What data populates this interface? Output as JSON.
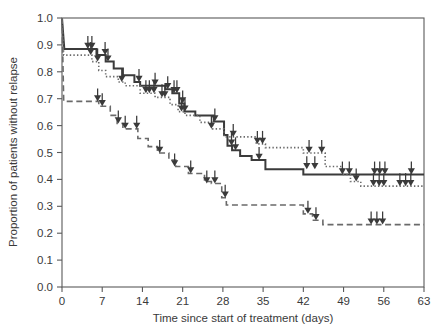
{
  "chart_data": {
    "type": "line",
    "subtype": "kaplan-meier-step",
    "title": "",
    "subtitle": "",
    "xlabel": "Time since start of treatment (days)",
    "ylabel": "Proportion of patients without relapse",
    "xlim": [
      0,
      63
    ],
    "ylim": [
      0.0,
      1.0
    ],
    "xticks": [
      0,
      7,
      14,
      21,
      28,
      35,
      42,
      49,
      56,
      63
    ],
    "xticklabels": [
      "0",
      "7",
      "14",
      "21",
      "28",
      "35",
      "42",
      "49",
      "56",
      "63"
    ],
    "yticks": [
      0.0,
      0.1,
      0.2,
      0.3,
      0.4,
      0.5,
      0.6,
      0.7,
      0.8,
      0.9,
      1.0
    ],
    "yticklabels": [
      "0.0",
      "0.1",
      "0.2",
      "0.3",
      "0.4",
      "0.5",
      "0.6",
      "0.7",
      "0.8",
      "0.9",
      "1.0"
    ],
    "grid": false,
    "legend": false,
    "legend_position": "none",
    "annotations": [
      "Downward arrows with filled triangular heads mark censored observations on each curve"
    ],
    "series": [
      {
        "name": "solid-curve",
        "style": "solid",
        "color": "#3b3b3b",
        "linewidth": 2.0,
        "points": [
          [
            0,
            1.0
          ],
          [
            0.4,
            0.885
          ],
          [
            6.0,
            0.885
          ],
          [
            6.0,
            0.862
          ],
          [
            7.6,
            0.862
          ],
          [
            7.6,
            0.838
          ],
          [
            9.0,
            0.838
          ],
          [
            9.0,
            0.812
          ],
          [
            10.6,
            0.812
          ],
          [
            10.6,
            0.787
          ],
          [
            12.6,
            0.787
          ],
          [
            12.6,
            0.762
          ],
          [
            13.6,
            0.762
          ],
          [
            13.6,
            0.748
          ],
          [
            18.0,
            0.748
          ],
          [
            18.0,
            0.735
          ],
          [
            19.2,
            0.735
          ],
          [
            19.2,
            0.72
          ],
          [
            20.4,
            0.72
          ],
          [
            20.4,
            0.682
          ],
          [
            21.3,
            0.682
          ],
          [
            21.3,
            0.652
          ],
          [
            23.2,
            0.652
          ],
          [
            23.2,
            0.638
          ],
          [
            26.4,
            0.638
          ],
          [
            26.4,
            0.615
          ],
          [
            28.2,
            0.615
          ],
          [
            28.2,
            0.565
          ],
          [
            28.8,
            0.565
          ],
          [
            28.8,
            0.525
          ],
          [
            29.6,
            0.525
          ],
          [
            29.6,
            0.508
          ],
          [
            31.0,
            0.508
          ],
          [
            31.0,
            0.487
          ],
          [
            33.0,
            0.487
          ],
          [
            33.0,
            0.472
          ],
          [
            35.4,
            0.472
          ],
          [
            35.4,
            0.438
          ],
          [
            42.0,
            0.438
          ],
          [
            42.0,
            0.418
          ],
          [
            63.0,
            0.418
          ]
        ],
        "censored": [
          [
            4.5,
            0.885
          ],
          [
            5.2,
            0.885
          ],
          [
            7.5,
            0.862
          ],
          [
            8.0,
            0.838
          ],
          [
            13.4,
            0.762
          ],
          [
            16.2,
            0.748
          ],
          [
            18.4,
            0.735
          ],
          [
            19.5,
            0.72
          ],
          [
            20.0,
            0.72
          ],
          [
            21.0,
            0.682
          ],
          [
            26.6,
            0.615
          ],
          [
            29.5,
            0.525
          ],
          [
            30.2,
            0.508
          ],
          [
            34.3,
            0.472
          ],
          [
            42.6,
            0.438
          ],
          [
            44.0,
            0.438
          ],
          [
            48.8,
            0.418
          ],
          [
            50.0,
            0.418
          ],
          [
            54.4,
            0.418
          ],
          [
            55.3,
            0.418
          ],
          [
            56.2,
            0.418
          ],
          [
            60.8,
            0.418
          ]
        ]
      },
      {
        "name": "dotted-curve",
        "style": "dotted",
        "color": "#6a6a6a",
        "linewidth": 1.6,
        "points": [
          [
            0,
            1.0
          ],
          [
            0.3,
            0.862
          ],
          [
            5.2,
            0.862
          ],
          [
            5.2,
            0.838
          ],
          [
            6.4,
            0.838
          ],
          [
            6.4,
            0.805
          ],
          [
            7.6,
            0.805
          ],
          [
            7.6,
            0.782
          ],
          [
            9.8,
            0.782
          ],
          [
            9.8,
            0.762
          ],
          [
            11.0,
            0.762
          ],
          [
            11.0,
            0.748
          ],
          [
            13.6,
            0.748
          ],
          [
            13.6,
            0.72
          ],
          [
            16.2,
            0.72
          ],
          [
            16.2,
            0.705
          ],
          [
            18.8,
            0.705
          ],
          [
            18.8,
            0.678
          ],
          [
            20.2,
            0.678
          ],
          [
            20.2,
            0.652
          ],
          [
            21.4,
            0.652
          ],
          [
            21.4,
            0.638
          ],
          [
            24.0,
            0.638
          ],
          [
            24.0,
            0.612
          ],
          [
            26.2,
            0.612
          ],
          [
            26.2,
            0.588
          ],
          [
            28.2,
            0.588
          ],
          [
            28.2,
            0.558
          ],
          [
            33.8,
            0.558
          ],
          [
            33.8,
            0.532
          ],
          [
            35.4,
            0.532
          ],
          [
            35.4,
            0.518
          ],
          [
            42.0,
            0.518
          ],
          [
            42.0,
            0.498
          ],
          [
            45.8,
            0.498
          ],
          [
            45.8,
            0.448
          ],
          [
            48.8,
            0.448
          ],
          [
            48.8,
            0.418
          ],
          [
            50.2,
            0.418
          ],
          [
            50.2,
            0.392
          ],
          [
            52.0,
            0.392
          ],
          [
            52.0,
            0.375
          ],
          [
            63.0,
            0.375
          ]
        ],
        "censored": [
          [
            5.0,
            0.862
          ],
          [
            6.2,
            0.838
          ],
          [
            10.4,
            0.762
          ],
          [
            14.6,
            0.72
          ],
          [
            15.2,
            0.72
          ],
          [
            16.0,
            0.72
          ],
          [
            17.4,
            0.705
          ],
          [
            17.9,
            0.705
          ],
          [
            20.8,
            0.652
          ],
          [
            21.4,
            0.652
          ],
          [
            26.0,
            0.588
          ],
          [
            29.8,
            0.558
          ],
          [
            34.0,
            0.532
          ],
          [
            34.9,
            0.532
          ],
          [
            43.0,
            0.498
          ],
          [
            45.2,
            0.498
          ],
          [
            51.2,
            0.392
          ],
          [
            54.2,
            0.375
          ],
          [
            55.2,
            0.375
          ],
          [
            56.0,
            0.375
          ],
          [
            58.8,
            0.375
          ],
          [
            59.8,
            0.375
          ],
          [
            60.7,
            0.375
          ]
        ]
      },
      {
        "name": "dashed-curve",
        "style": "dashed",
        "color": "#6a6a6a",
        "linewidth": 1.6,
        "points": [
          [
            0,
            1.0
          ],
          [
            0.3,
            0.69
          ],
          [
            6.4,
            0.69
          ],
          [
            6.4,
            0.672
          ],
          [
            8.4,
            0.672
          ],
          [
            8.4,
            0.638
          ],
          [
            9.6,
            0.638
          ],
          [
            9.6,
            0.608
          ],
          [
            10.6,
            0.608
          ],
          [
            10.6,
            0.588
          ],
          [
            13.2,
            0.588
          ],
          [
            13.2,
            0.552
          ],
          [
            15.0,
            0.552
          ],
          [
            15.0,
            0.522
          ],
          [
            16.6,
            0.522
          ],
          [
            16.6,
            0.498
          ],
          [
            18.6,
            0.498
          ],
          [
            18.6,
            0.472
          ],
          [
            19.8,
            0.472
          ],
          [
            19.8,
            0.448
          ],
          [
            22.0,
            0.448
          ],
          [
            22.0,
            0.422
          ],
          [
            24.8,
            0.422
          ],
          [
            24.8,
            0.392
          ],
          [
            26.0,
            0.392
          ],
          [
            26.0,
            0.385
          ],
          [
            27.8,
            0.385
          ],
          [
            27.8,
            0.332
          ],
          [
            28.6,
            0.332
          ],
          [
            28.6,
            0.305
          ],
          [
            42.0,
            0.305
          ],
          [
            42.0,
            0.272
          ],
          [
            43.6,
            0.272
          ],
          [
            43.6,
            0.248
          ],
          [
            45.4,
            0.248
          ],
          [
            45.4,
            0.232
          ],
          [
            63.0,
            0.232
          ]
        ],
        "censored": [
          [
            6.2,
            0.69
          ],
          [
            7.0,
            0.672
          ],
          [
            9.8,
            0.608
          ],
          [
            11.0,
            0.588
          ],
          [
            13.0,
            0.588
          ],
          [
            17.0,
            0.498
          ],
          [
            19.6,
            0.448
          ],
          [
            22.4,
            0.422
          ],
          [
            25.2,
            0.385
          ],
          [
            26.6,
            0.385
          ],
          [
            28.4,
            0.332
          ],
          [
            42.8,
            0.272
          ],
          [
            44.2,
            0.248
          ],
          [
            53.8,
            0.232
          ],
          [
            54.8,
            0.232
          ],
          [
            55.8,
            0.232
          ]
        ]
      }
    ]
  },
  "style": {
    "axis_color": "#5a5a5a",
    "text_color": "#3a3a3a",
    "background": "#ffffff"
  }
}
